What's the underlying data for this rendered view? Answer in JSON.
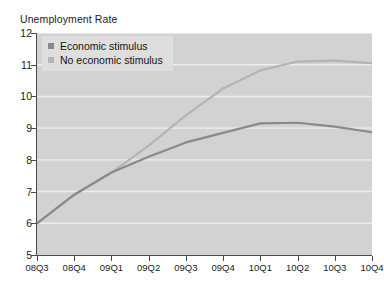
{
  "chart_data": {
    "type": "line",
    "title": "Unemployment Rate",
    "xlabel": "",
    "ylabel": "",
    "ylim": [
      5,
      12
    ],
    "yticks": [
      12,
      11,
      10,
      9,
      8,
      7,
      6,
      5
    ],
    "grid": true,
    "legend_position": "top-left",
    "categories": [
      "08Q3",
      "08Q4",
      "09Q1",
      "09Q2",
      "09Q3",
      "09Q4",
      "10Q1",
      "10Q2",
      "10Q3",
      "10Q4"
    ],
    "series": [
      {
        "name": "Economic stimulus",
        "color": "#8a8a8a",
        "values": [
          6.0,
          6.9,
          7.6,
          8.1,
          8.55,
          8.85,
          9.15,
          9.17,
          9.05,
          8.87
        ]
      },
      {
        "name": "No economic stimulus",
        "color": "#b4b4b4",
        "values": [
          6.0,
          6.9,
          7.6,
          8.45,
          9.4,
          10.25,
          10.82,
          11.1,
          11.13,
          11.05
        ]
      }
    ]
  },
  "legend": {
    "items": [
      {
        "label": "Economic stimulus",
        "color": "#8a8a8a"
      },
      {
        "label": "No economic stimulus",
        "color": "#b4b4b4"
      }
    ]
  },
  "colors": {
    "plot_background": "#d2d2d2",
    "gridline": "#ededed",
    "axis": "#4b4b4b",
    "legend_background": "#dedede",
    "page_background": "#ffffff",
    "text": "#1c1c1c"
  }
}
